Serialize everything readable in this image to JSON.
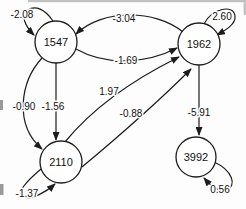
{
  "diagram": {
    "type": "path-diagram",
    "background": "#fdfdfd",
    "line_color": "#1c1c1c",
    "nodes": [
      {
        "id": "1547",
        "label": "1547",
        "x": 56,
        "y": 42,
        "r": 21
      },
      {
        "id": "1962",
        "label": "1962",
        "x": 199,
        "y": 44,
        "r": 21
      },
      {
        "id": "2110",
        "label": "2110",
        "x": 61,
        "y": 162,
        "r": 21
      },
      {
        "id": "3992",
        "label": "3992",
        "x": 196,
        "y": 157,
        "r": 20
      }
    ],
    "edges": [
      {
        "from": "1547",
        "to": "1547",
        "kind": "self-loop",
        "label": "-2.08"
      },
      {
        "from": "1962",
        "to": "1547",
        "kind": "curve",
        "label": "-3.04"
      },
      {
        "from": "1547",
        "to": "1962",
        "kind": "curve",
        "label": "-1.69"
      },
      {
        "from": "1962",
        "to": "1962",
        "kind": "self-loop",
        "label": "2.60"
      },
      {
        "from": "1547",
        "to": "2110",
        "kind": "straight",
        "label": "-1.56"
      },
      {
        "from": "1547",
        "to": "2110",
        "kind": "curve",
        "label": "-0.90"
      },
      {
        "from": "2110",
        "to": "2110",
        "kind": "self-loop",
        "label": "-1.37"
      },
      {
        "from": "2110",
        "to": "1962",
        "kind": "straight",
        "label": "1.97"
      },
      {
        "from": "2110",
        "to": "1962",
        "kind": "curve",
        "label": "-0.88"
      },
      {
        "from": "1962",
        "to": "3992",
        "kind": "straight",
        "label": "-5.91"
      },
      {
        "from": "3992",
        "to": "3992",
        "kind": "self-loop",
        "label": "0.56"
      }
    ]
  }
}
